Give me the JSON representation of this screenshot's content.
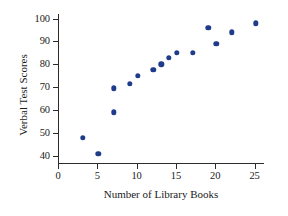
{
  "chart_data": {
    "type": "scatter",
    "title": "",
    "xlabel": "Number of Library Books",
    "ylabel": "Verbal Test Scores",
    "xlim": [
      0,
      26.2
    ],
    "ylim": [
      36.5,
      102
    ],
    "xticks": [
      0,
      5,
      10,
      15,
      20,
      25
    ],
    "yticks": [
      40,
      50,
      60,
      70,
      80,
      90,
      100
    ],
    "xtick_labels": [
      "0",
      "5",
      "10",
      "15",
      "20",
      "25"
    ],
    "ytick_labels": [
      "40",
      "50",
      "60",
      "70",
      "80",
      "90",
      "100"
    ],
    "grid": false,
    "legend": null,
    "marker_color": "#1f3c8b",
    "axis_color": "#2b2b2b",
    "background": "#ffffff",
    "points": [
      {
        "x": 3,
        "y": 48
      },
      {
        "x": 5,
        "y": 41
      },
      {
        "x": 7,
        "y": 59
      },
      {
        "x": 7,
        "y": 69.5
      },
      {
        "x": 9,
        "y": 71.5
      },
      {
        "x": 10,
        "y": 75
      },
      {
        "x": 12,
        "y": 77.5
      },
      {
        "x": 13,
        "y": 80
      },
      {
        "x": 14,
        "y": 83
      },
      {
        "x": 15,
        "y": 85
      },
      {
        "x": 17,
        "y": 85
      },
      {
        "x": 19,
        "y": 96
      },
      {
        "x": 20,
        "y": 89
      },
      {
        "x": 22,
        "y": 94
      },
      {
        "x": 25,
        "y": 98
      }
    ]
  }
}
